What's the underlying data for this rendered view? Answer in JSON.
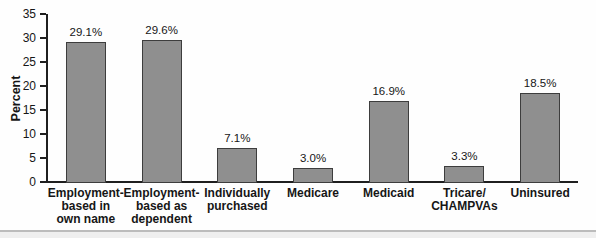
{
  "chart_data": {
    "type": "bar",
    "title": "",
    "xlabel": "",
    "ylabel": "Percent",
    "ylim": [
      0,
      35
    ],
    "yticks": [
      0,
      5,
      10,
      15,
      20,
      25,
      30,
      35
    ],
    "grid": false,
    "legend": "none",
    "categories": [
      "Employment-based in own name",
      "Employment-based as dependent",
      "Individually purchased",
      "Medicare",
      "Medicaid",
      "Tricare/CHAMPVAs",
      "Uninsured"
    ],
    "category_labels": [
      "Employment-\nbased in\nown name",
      "Employment-\nbased as\ndependent",
      "Individually\npurchased",
      "Medicare",
      "Medicaid",
      "Tricare/\nCHAMPVAs",
      "Uninsured"
    ],
    "values": [
      29.1,
      29.6,
      7.1,
      3.0,
      16.9,
      3.3,
      18.5
    ],
    "value_labels": [
      "29.1%",
      "29.6%",
      "7.1%",
      "3.0%",
      "16.9%",
      "3.3%",
      "18.5%"
    ],
    "colors": {
      "bar_fill": "#8f8f8f",
      "bar_border": "#3d3d3d",
      "axis": "#1f1f1f",
      "text": "#161616",
      "footer_line": "#bcbcbc",
      "footer_band": "#efefef"
    }
  }
}
